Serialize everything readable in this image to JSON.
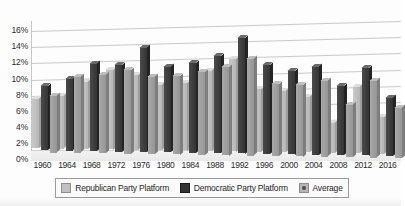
{
  "chart_data": {
    "type": "bar",
    "title": "",
    "xlabel": "",
    "ylabel": "",
    "ylim": [
      0,
      16
    ],
    "ytick_labels": [
      "16%",
      "14%",
      "12%",
      "10%",
      "8%",
      "6%",
      "4%",
      "2%",
      "0%"
    ],
    "ytick_values": [
      16,
      14,
      12,
      10,
      8,
      6,
      4,
      2,
      0
    ],
    "grid": true,
    "legend_position": "bottom",
    "categories": [
      "1960",
      "1964",
      "1968",
      "1972",
      "1976",
      "1980",
      "1984",
      "1988",
      "1992",
      "1996",
      "2000",
      "2004",
      "2008",
      "2012",
      "2016"
    ],
    "series": [
      {
        "name": "Republican Party Platform",
        "color": "#c0c0c0",
        "values": [
          6.2,
          6.6,
          8.4,
          9.9,
          9.3,
          8.2,
          8.4,
          10.0,
          11.5,
          7.8,
          7.7,
          7.0,
          3.8,
          8.3,
          4.6
        ]
      },
      {
        "name": "Democratic Party Platform",
        "color": "#333333",
        "values": [
          8.0,
          9.0,
          10.9,
          10.8,
          13.0,
          10.7,
          11.2,
          12.1,
          14.4,
          11.1,
          10.4,
          11.0,
          8.6,
          10.9,
          7.3
        ]
      },
      {
        "name": "Average",
        "color": "#b5b5b5",
        "values": [
          7.1,
          9.5,
          9.8,
          10.4,
          9.7,
          9.8,
          10.3,
          11.0,
          12.1,
          9.0,
          8.9,
          9.5,
          6.6,
          9.6,
          6.3
        ]
      }
    ]
  },
  "legend": {
    "items": [
      {
        "label": "Republican Party Platform",
        "swatch": "rep-swatch-icon"
      },
      {
        "label": "Democratic Party Platform",
        "swatch": "dem-swatch-icon"
      },
      {
        "label": "Average",
        "swatch": "avg-swatch-icon"
      }
    ]
  }
}
